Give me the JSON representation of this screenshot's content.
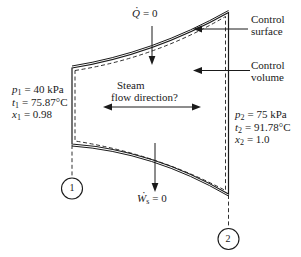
{
  "figure": {
    "background": "#ffffff",
    "line_color": "#1a1a1a"
  },
  "labels": {
    "heat": {
      "dot": "·",
      "var": "Q",
      "eq": "= 0"
    },
    "work": {
      "dot": "·",
      "var": "W",
      "sub": "s",
      "eq": "= 0"
    },
    "control_surface": {
      "line1": "Control",
      "line2": "surface"
    },
    "control_volume": {
      "line1": "Control",
      "line2": "volume"
    },
    "steam": {
      "line1": "Steam",
      "line2": "flow direction?"
    }
  },
  "state1": {
    "p": {
      "var": "p",
      "sub": "1",
      "eq": "= 40 kPa"
    },
    "t": {
      "var": "t",
      "sub": "1",
      "eq": "= 75.87°C"
    },
    "x": {
      "var": "x",
      "sub": "1",
      "eq": "= 0.98"
    }
  },
  "state2": {
    "p": {
      "var": "p",
      "sub": "2",
      "eq": "= 75 kPa"
    },
    "t": {
      "var": "t",
      "sub": "2",
      "eq": "= 91.78°C"
    },
    "x": {
      "var": "x",
      "sub": "2",
      "eq": "= 1.0"
    }
  },
  "stations": {
    "inlet": "1",
    "outlet": "2"
  }
}
